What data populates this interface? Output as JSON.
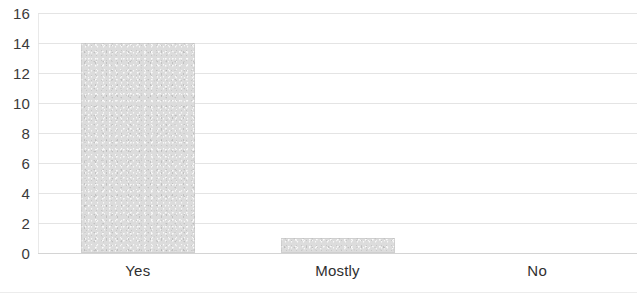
{
  "chart_data": {
    "type": "bar",
    "title": "",
    "subtitle": "",
    "xlabel": "",
    "ylabel": "",
    "categories": [
      "Yes",
      "Mostly",
      "No"
    ],
    "values": [
      14,
      1,
      0
    ],
    "series": [
      {
        "name": "Responses",
        "values": [
          14,
          1,
          0
        ]
      }
    ],
    "ylim": [
      0,
      16
    ],
    "xlim": null,
    "y_ticks": [
      0,
      2,
      4,
      6,
      8,
      10,
      12,
      14,
      16
    ],
    "y_tick_labels": [
      "0",
      "2",
      "4",
      "6",
      "8",
      "10",
      "12",
      "14",
      "16"
    ],
    "x_tick_labels": [
      "Yes",
      "Mostly",
      "No"
    ],
    "grid": "horizontal",
    "legend": null,
    "legend_position": "none",
    "annotations": [],
    "bar_color": "#dcdcdc",
    "bar_border_color": "#c4c4c4",
    "gridline_color": "#e4e4e4",
    "axis_color": "#d4d4d4",
    "text_color": "#2f2f2f",
    "background_color": "#ffffff"
  }
}
